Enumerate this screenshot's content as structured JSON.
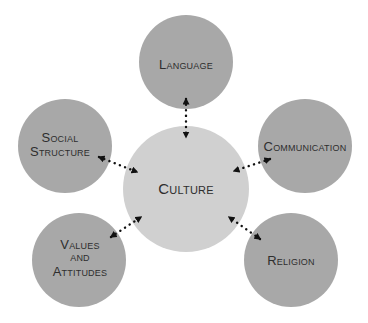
{
  "diagram": {
    "background": "#ffffff",
    "colors": {
      "outer_node_fill": "#a8a8a8",
      "center_node_fill": "#d0d0d0",
      "text": "#2e2e2e",
      "arrow": "#111111"
    },
    "center": {
      "id": "culture",
      "lines": [
        "Culture"
      ],
      "cx": 186,
      "cy": 189,
      "r": 63
    },
    "nodes": [
      {
        "id": "language",
        "lines": [
          "Language"
        ],
        "cx": 186,
        "cy": 62,
        "r": 47,
        "label_x": 186,
        "label_y": [
          69
        ]
      },
      {
        "id": "social-structure",
        "lines": [
          "Social",
          "Structure"
        ],
        "cx": 65,
        "cy": 146,
        "r": 47,
        "label_x": 60,
        "label_y": [
          142,
          156
        ]
      },
      {
        "id": "communication",
        "lines": [
          "Communication"
        ],
        "cx": 305,
        "cy": 146,
        "r": 47,
        "label_x": 305,
        "label_y": [
          151
        ]
      },
      {
        "id": "values-and-attitudes",
        "lines": [
          "Values",
          "and",
          "Attitudes"
        ],
        "cx": 79,
        "cy": 260,
        "r": 47,
        "label_x": 80,
        "label_y": [
          249,
          261,
          276
        ]
      },
      {
        "id": "religion",
        "lines": [
          "Religion"
        ],
        "cx": 291,
        "cy": 260,
        "r": 47,
        "label_x": 291,
        "label_y": [
          265
        ]
      }
    ],
    "connectors": [
      {
        "id": "language-culture",
        "from": "language",
        "to": "culture",
        "x1": 186,
        "y1": 99,
        "x2": 186,
        "y2": 137,
        "style": "dotted-double-arrow"
      },
      {
        "id": "social-structure-culture",
        "from": "social-structure",
        "to": "culture",
        "x1": 99,
        "y1": 157,
        "x2": 137,
        "y2": 172,
        "style": "dotted-double-arrow"
      },
      {
        "id": "communication-culture",
        "from": "communication",
        "to": "culture",
        "x1": 270,
        "y1": 159,
        "x2": 234,
        "y2": 171,
        "style": "dotted-double-arrow"
      },
      {
        "id": "values-and-attitudes-culture",
        "from": "values-and-attitudes",
        "to": "culture",
        "x1": 111,
        "y1": 237,
        "x2": 141,
        "y2": 217,
        "style": "dotted-double-arrow"
      },
      {
        "id": "religion-culture",
        "from": "religion",
        "to": "culture",
        "x1": 260,
        "y1": 239,
        "x2": 229,
        "y2": 217,
        "style": "dotted-double-arrow"
      }
    ]
  }
}
